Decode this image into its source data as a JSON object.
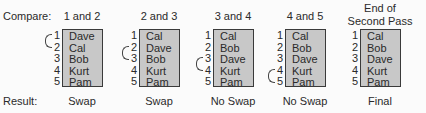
{
  "labels": {
    "compare": "Compare:",
    "result": "Result:"
  },
  "steps": [
    {
      "header": "1 and 2",
      "names": [
        "Dave",
        "Cal",
        "Bob",
        "Kurt",
        "Pam"
      ],
      "result": "Swap",
      "bracket": [
        1,
        2
      ]
    },
    {
      "header": "2 and 3",
      "names": [
        "Cal",
        "Dave",
        "Bob",
        "Kurt",
        "Pam"
      ],
      "result": "Swap",
      "bracket": [
        2,
        3
      ]
    },
    {
      "header": "3 and 4",
      "names": [
        "Cal",
        "Bob",
        "Dave",
        "Kurt",
        "Pam"
      ],
      "result": "No Swap",
      "bracket": [
        3,
        4
      ]
    },
    {
      "header": "4 and 5",
      "names": [
        "Cal",
        "Bob",
        "Dave",
        "Kurt",
        "Pam"
      ],
      "result": "No Swap",
      "bracket": [
        4,
        5
      ]
    },
    {
      "header_line1": "End of",
      "header_line2": "Second Pass",
      "names": [
        "Cal",
        "Bob",
        "Dave",
        "Kurt",
        "Pam"
      ],
      "result": "Final"
    }
  ],
  "positions": [
    "1",
    "2",
    "3",
    "4",
    "5"
  ],
  "colors": {
    "box_fill": "#c8c8c8",
    "border": "#3a3a3a",
    "text": "#2a2a2a"
  }
}
